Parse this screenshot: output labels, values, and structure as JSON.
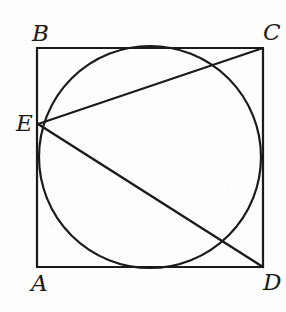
{
  "figure": {
    "name": "square-with-inscribed-circle-and-chords",
    "width": 286,
    "height": 312,
    "background_color": "#fdfdfc",
    "stroke_color": "#1b1b1b",
    "labels": {
      "a": "A",
      "b": "B",
      "c": "C",
      "d": "D",
      "e": "E"
    }
  },
  "chart_data": {
    "type": "diagram",
    "title": "",
    "subtitle": "",
    "xlabel": "",
    "ylabel": "",
    "shapes": [
      {
        "kind": "square",
        "name": "square-abcd",
        "vertices": [
          {
            "label": "B",
            "x": 37,
            "y": 48
          },
          {
            "label": "C",
            "x": 263,
            "y": 48
          },
          {
            "label": "D",
            "x": 263,
            "y": 267
          },
          {
            "label": "A",
            "x": 37,
            "y": 267
          }
        ],
        "side_px": 223,
        "stroke_width": 2.2
      },
      {
        "kind": "circle",
        "name": "inscribed-circle",
        "cx": 150,
        "cy": 157,
        "r": 111,
        "stroke_width": 2.2,
        "tangent_points": [
          {
            "side": "BC",
            "x": 150,
            "y": 46
          },
          {
            "side": "CD",
            "x": 261,
            "y": 157
          },
          {
            "side": "AD",
            "x": 150,
            "y": 268
          },
          {
            "side": "AB",
            "x": 39,
            "y": 157
          }
        ]
      },
      {
        "kind": "point",
        "name": "point-e",
        "label": "E",
        "x": 38,
        "y": 124,
        "on": "side AB"
      },
      {
        "kind": "segment",
        "name": "chord-ec",
        "from": {
          "label": "E",
          "x": 38,
          "y": 124
        },
        "to": {
          "label": "C",
          "x": 263,
          "y": 48
        },
        "stroke_width": 2.2
      },
      {
        "kind": "segment",
        "name": "chord-ed",
        "from": {
          "label": "E",
          "x": 38,
          "y": 124
        },
        "to": {
          "label": "D",
          "x": 263,
          "y": 267
        },
        "stroke_width": 2.4
      }
    ],
    "label_positions": [
      {
        "text": "B",
        "x": 32,
        "y": 22,
        "anchor": "top-left"
      },
      {
        "text": "C",
        "x": 263,
        "y": 21,
        "anchor": "top-left"
      },
      {
        "text": "E",
        "x": 16,
        "y": 112,
        "anchor": "top-left"
      },
      {
        "text": "A",
        "x": 31,
        "y": 272,
        "anchor": "top-left"
      },
      {
        "text": "D",
        "x": 263,
        "y": 271,
        "anchor": "top-left"
      }
    ],
    "grid": false,
    "legend": null
  }
}
